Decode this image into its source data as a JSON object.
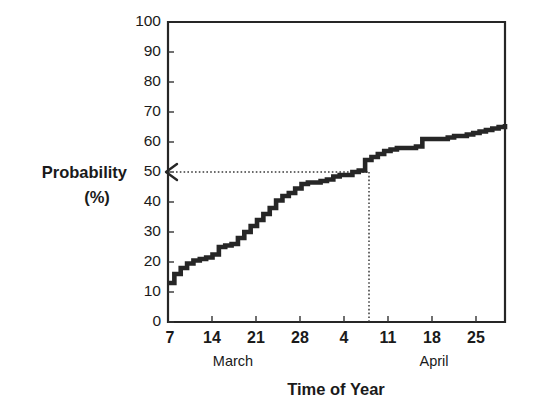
{
  "chart_data": {
    "type": "line",
    "title": "",
    "xlabel": "Time of Year",
    "ylabel": "Probability",
    "ylabel_units": "(%)",
    "ylim": [
      0,
      100
    ],
    "yticks": [
      0,
      10,
      20,
      30,
      40,
      50,
      60,
      70,
      80,
      90,
      100
    ],
    "ytick_labels": [
      "0",
      "10",
      "20",
      "30",
      "40",
      "50",
      "60",
      "70",
      "80",
      "90",
      "100"
    ],
    "xticks": [
      7,
      14,
      21,
      28,
      35,
      42,
      49,
      56
    ],
    "xtick_labels": [
      "7",
      "14",
      "21",
      "28",
      "4",
      "11",
      "18",
      "25"
    ],
    "xlim": [
      7,
      60
    ],
    "x_group_labels": [
      {
        "label": "March",
        "at_day": 17
      },
      {
        "label": "April",
        "at_day": 48
      }
    ],
    "grid": false,
    "legend": null,
    "series_name": "Cumulative probability of occurrence",
    "x": [
      7,
      8,
      9,
      10,
      11,
      12,
      13,
      14,
      15,
      16,
      17,
      18,
      19,
      20,
      21,
      22,
      23,
      24,
      25,
      26,
      27,
      28,
      29,
      30,
      31,
      32,
      33,
      34,
      35,
      36,
      37,
      38,
      39,
      40,
      41,
      42,
      43,
      44,
      45,
      46,
      47,
      48,
      49,
      50,
      51,
      52,
      53,
      54,
      55,
      56,
      57,
      58,
      59,
      60
    ],
    "values": [
      13,
      16,
      18,
      19.5,
      20.5,
      21,
      21.5,
      22.5,
      25,
      25.5,
      26,
      28,
      30,
      32,
      34,
      36,
      38,
      40.5,
      42,
      43,
      44.5,
      46,
      46.5,
      46.5,
      47,
      47.5,
      48.5,
      49,
      49,
      50,
      50.5,
      54,
      55,
      56,
      57,
      57.5,
      58,
      58,
      58,
      58.5,
      61,
      61,
      61,
      61,
      61.5,
      62,
      62,
      62.5,
      63,
      63.5,
      64,
      64.5,
      65,
      66
    ],
    "annotations": [
      {
        "type": "dotted-guide",
        "description": "Dotted horizontal line at 50% probability with leftward arrow to the y-axis, and dotted vertical line dropping to the x-axis",
        "y_value": 50,
        "x_value_day": 36,
        "arrow_direction": "left"
      }
    ],
    "line_color": "#262626",
    "axis_color": "#262626",
    "background_color": "#ffffff"
  }
}
